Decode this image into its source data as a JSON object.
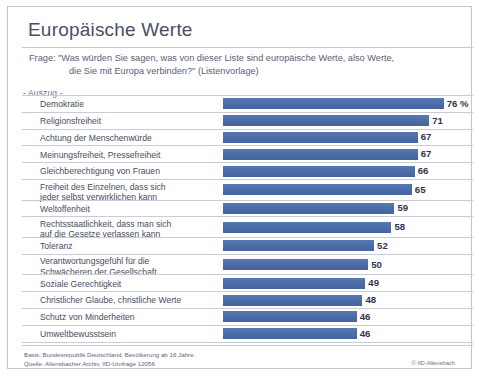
{
  "header": {
    "title": "Europäische Werte",
    "question_line1": "Frage: \"Was würden Sie sagen, was von dieser Liste sind europäische Werte, also Werte,",
    "question_line2": "die Sie mit Europa verbinden?\" (Listenvorlage)",
    "excerpt_label": "- Auszug -"
  },
  "footer": {
    "basis": "Basis: Bundesrepublik Deutschland, Bevölkerung ab 16 Jahre",
    "source": "Quelle: Allensbacher Archiv, IfD-Umfrage 12056",
    "copyright": "© IfD-Allensbach"
  },
  "colors": {
    "bar": "#4b6daa",
    "rule": "#c9ccd6",
    "title_text": "#4a4f63",
    "label_text": "#474c60",
    "value_text": "#2e3550",
    "panel_bg": "#ffffff"
  },
  "chart_data": {
    "type": "bar",
    "orientation": "horizontal",
    "title": "Europäische Werte",
    "subtitle": "Frage: \"Was würden Sie sagen, was von dieser Liste sind europäische Werte, also Werte, die Sie mit Europa verbinden?\" (Listenvorlage)",
    "xlabel": "",
    "ylabel": "",
    "xlim": [
      0,
      80
    ],
    "grid": false,
    "legend": "none",
    "unit": "%",
    "categories": [
      "Demokratie",
      "Religionsfreiheit",
      "Achtung der Menschenwürde",
      "Meinungsfreiheit, Pressefreiheit",
      "Gleichberechtigung von Frauen",
      "Freiheit des Einzelnen, dass sich\njeder selbst verwirklichen kann",
      "Weltoffenheit",
      "Rechtsstaatlichkeit, dass man sich\nauf die Gesetze verlassen kann",
      "Toleranz",
      "Verantwortungsgefühl für die\nSchwächeren der Gesellschaft",
      "Soziale Gerechtigkeit",
      "Christlicher Glaube, christliche Werte",
      "Schutz von Minderheiten",
      "Umweltbewusstsein"
    ],
    "values": [
      76,
      71,
      67,
      67,
      66,
      65,
      59,
      58,
      52,
      50,
      49,
      48,
      46,
      46
    ],
    "value_labels": [
      "76 %",
      "71",
      "67",
      "67",
      "66",
      "65",
      "59",
      "58",
      "52",
      "50",
      "49",
      "48",
      "46",
      "46"
    ]
  }
}
